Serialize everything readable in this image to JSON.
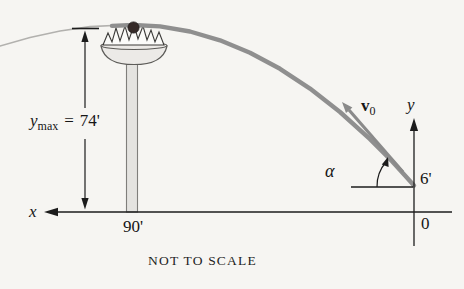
{
  "figure": {
    "caption": "NOT TO SCALE",
    "labels": {
      "ymax_var": "y",
      "ymax_sub": "max",
      "ymax_eq": "=",
      "ymax_value": "74'",
      "ground_distance": "90'",
      "launch_height": "6'",
      "origin": "0",
      "x_axis": "x",
      "y_axis": "y",
      "launch_angle": "α",
      "velocity_var": "v",
      "velocity_sub": "0"
    },
    "colors": {
      "background": "#f6f5f2",
      "trajectory": "#8f8f8f",
      "trajectory_faint": "#b2b1ae",
      "velocity": "#8a8a8a",
      "axis": "#1c1c1c",
      "pole_fill": "#e4e3e0",
      "bowl_fill": "#eceae7",
      "nest_fill": "#fbfbf9",
      "ball": "#352a28"
    }
  }
}
